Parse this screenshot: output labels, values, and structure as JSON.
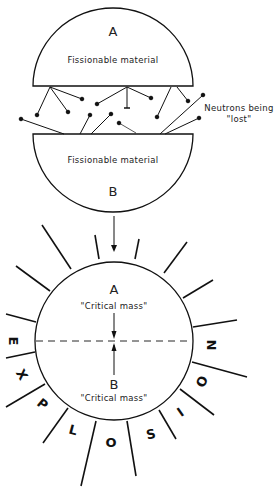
{
  "diagram": {
    "top_section": {
      "piece_a": {
        "letter": "A",
        "label": "Fissionable material"
      },
      "piece_b": {
        "letter": "B",
        "label": "Fissionable material"
      },
      "neutron_label_line1": "Neutrons being",
      "neutron_label_line2": "\"lost\""
    },
    "bottom_section": {
      "half_a": {
        "letter": "A",
        "label": "\"Critical mass\""
      },
      "half_b": {
        "letter": "B",
        "label": "\"Critical mass\""
      },
      "burst_letters": [
        "E",
        "X",
        "P",
        "L",
        "O",
        "S",
        "I",
        "O",
        "N"
      ]
    },
    "colors": {
      "ink": "#111111",
      "background": "#ffffff"
    }
  }
}
